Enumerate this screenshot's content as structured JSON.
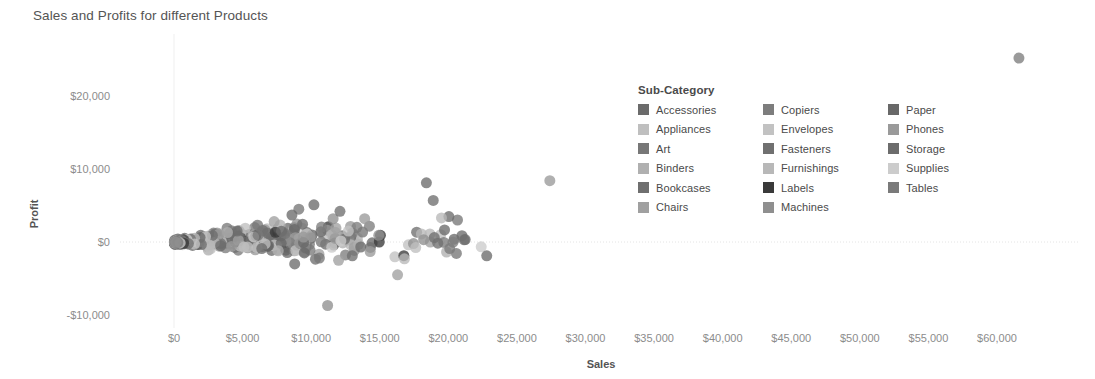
{
  "chart_data": {
    "type": "scatter",
    "title": "Sales and Profits for different Products",
    "xlabel": "Sales",
    "ylabel": "Profit",
    "xlim": [
      -1000,
      61800
    ],
    "ylim": [
      -13000,
      27500
    ],
    "grid": false,
    "zero_line": true,
    "legend": {
      "title": "Sub-Category",
      "position": "inside-top-right",
      "columns": 3,
      "entries": [
        {
          "label": "Accessories",
          "color": "#6b6b6b"
        },
        {
          "label": "Appliances",
          "color": "#bfbfbf"
        },
        {
          "label": "Art",
          "color": "#777777"
        },
        {
          "label": "Binders",
          "color": "#b0b0b0"
        },
        {
          "label": "Bookcases",
          "color": "#6f6f6f"
        },
        {
          "label": "Chairs",
          "color": "#a0a0a0"
        },
        {
          "label": "Copiers",
          "color": "#7d7d7d"
        },
        {
          "label": "Envelopes",
          "color": "#c2c2c2"
        },
        {
          "label": "Fasteners",
          "color": "#707070"
        },
        {
          "label": "Furnishings",
          "color": "#b8b8b8"
        },
        {
          "label": "Labels",
          "color": "#3a3a3a"
        },
        {
          "label": "Machines",
          "color": "#8f8f8f"
        },
        {
          "label": "Paper",
          "color": "#686868"
        },
        {
          "label": "Phones",
          "color": "#9a9a9a"
        },
        {
          "label": "Storage",
          "color": "#6c6c6c"
        },
        {
          "label": "Supplies",
          "color": "#cccccc"
        },
        {
          "label": "Tables",
          "color": "#7a7a7a"
        }
      ]
    },
    "x_ticks": [
      {
        "value": 0,
        "label": "$0"
      },
      {
        "value": 5000,
        "label": "$5,000"
      },
      {
        "value": 10000,
        "label": "$10,000"
      },
      {
        "value": 15000,
        "label": "$15,000"
      },
      {
        "value": 20000,
        "label": "$20,000"
      },
      {
        "value": 25000,
        "label": "$25,000"
      },
      {
        "value": 30000,
        "label": "$30,000"
      },
      {
        "value": 35000,
        "label": "$35,000"
      },
      {
        "value": 40000,
        "label": "$40,000"
      },
      {
        "value": 45000,
        "label": "$45,000"
      },
      {
        "value": 50000,
        "label": "$50,000"
      },
      {
        "value": 55000,
        "label": "$55,000"
      },
      {
        "value": 60000,
        "label": "$60,000"
      }
    ],
    "y_ticks": [
      {
        "value": 20000,
        "label": "$20,000"
      },
      {
        "value": 10000,
        "label": "$10,000"
      },
      {
        "value": 0,
        "label": "$0"
      },
      {
        "value": -10000,
        "label": "-$10,000"
      }
    ],
    "points": [
      {
        "x": 61599,
        "y": 25200,
        "c": "#7d7d7d"
      },
      {
        "x": 27400,
        "y": 8400,
        "c": "#9a9a9a"
      },
      {
        "x": 18400,
        "y": 8100,
        "c": "#6b6b6b"
      },
      {
        "x": 18900,
        "y": 5700,
        "c": "#6f6f6f"
      },
      {
        "x": 10200,
        "y": 5100,
        "c": "#6b6b6b"
      },
      {
        "x": 19500,
        "y": 3300,
        "c": "#b8b8b8"
      },
      {
        "x": 13900,
        "y": 3200,
        "c": "#9a9a9a"
      },
      {
        "x": 9100,
        "y": 4500,
        "c": "#777777"
      },
      {
        "x": 8600,
        "y": 3700,
        "c": "#6b6b6b"
      },
      {
        "x": 11600,
        "y": 3200,
        "c": "#8f8f8f"
      },
      {
        "x": 12100,
        "y": 4200,
        "c": "#6f6f6f"
      },
      {
        "x": 7300,
        "y": 2800,
        "c": "#a0a0a0"
      },
      {
        "x": 6100,
        "y": 2300,
        "c": "#777777"
      },
      {
        "x": 5200,
        "y": 1900,
        "c": "#bfbfbf"
      },
      {
        "x": 4600,
        "y": 1500,
        "c": "#6b6b6b"
      },
      {
        "x": 3900,
        "y": 1300,
        "c": "#b0b0b0"
      },
      {
        "x": 3300,
        "y": 1100,
        "c": "#a0a0a0"
      },
      {
        "x": 2800,
        "y": 900,
        "c": "#6c6c6c"
      },
      {
        "x": 2300,
        "y": 750,
        "c": "#c2c2c2"
      },
      {
        "x": 1900,
        "y": 600,
        "c": "#686868"
      },
      {
        "x": 1500,
        "y": 500,
        "c": "#b8b8b8"
      },
      {
        "x": 1200,
        "y": 400,
        "c": "#707070"
      },
      {
        "x": 950,
        "y": 330,
        "c": "#cccccc"
      },
      {
        "x": 720,
        "y": 260,
        "c": "#3a3a3a"
      },
      {
        "x": 560,
        "y": 200,
        "c": "#7a7a7a"
      },
      {
        "x": 420,
        "y": 150,
        "c": "#6b6b6b"
      },
      {
        "x": 300,
        "y": 110,
        "c": "#9a9a9a"
      },
      {
        "x": 220,
        "y": 80,
        "c": "#777777"
      },
      {
        "x": 150,
        "y": 50,
        "c": "#6f6f6f"
      },
      {
        "x": 100,
        "y": 30,
        "c": "#8f8f8f"
      },
      {
        "x": 14300,
        "y": -1300,
        "c": "#9a9a9a"
      },
      {
        "x": 16800,
        "y": -2300,
        "c": "#b8b8b8"
      },
      {
        "x": 20100,
        "y": -900,
        "c": "#7a7a7a"
      },
      {
        "x": 22800,
        "y": -1900,
        "c": "#6c6c6c"
      },
      {
        "x": 16300,
        "y": -4500,
        "c": "#a0a0a0"
      },
      {
        "x": 11200,
        "y": -8700,
        "c": "#8f8f8f"
      },
      {
        "x": 8800,
        "y": -3000,
        "c": "#6b6b6b"
      },
      {
        "x": 13000,
        "y": -1900,
        "c": "#6f6f6f"
      },
      {
        "x": 12000,
        "y": -2500,
        "c": "#a0a0a0"
      },
      {
        "x": 10600,
        "y": -2200,
        "c": "#777777"
      },
      {
        "x": 9500,
        "y": -1500,
        "c": "#686868"
      },
      {
        "x": 7600,
        "y": -1200,
        "c": "#b0b0b0"
      },
      {
        "x": 6400,
        "y": -900,
        "c": "#6b6b6b"
      },
      {
        "x": 5100,
        "y": -700,
        "c": "#bfbfbf"
      },
      {
        "x": 4200,
        "y": -600,
        "c": "#9a9a9a"
      },
      {
        "x": 3400,
        "y": -500,
        "c": "#6c6c6c"
      },
      {
        "x": 2600,
        "y": -420,
        "c": "#b8b8b8"
      },
      {
        "x": 2000,
        "y": -350,
        "c": "#707070"
      },
      {
        "x": 1500,
        "y": -280,
        "c": "#c2c2c2"
      },
      {
        "x": 1050,
        "y": -220,
        "c": "#6f6f6f"
      },
      {
        "x": 700,
        "y": -170,
        "c": "#3a3a3a"
      },
      {
        "x": 450,
        "y": -120,
        "c": "#cccccc"
      },
      {
        "x": 280,
        "y": -80,
        "c": "#7a7a7a"
      },
      {
        "x": 160,
        "y": -50,
        "c": "#8f8f8f"
      }
    ],
    "point_count_approx": 420,
    "marker": {
      "shape": "circle",
      "size_px": 11,
      "opacity": 0.78
    }
  }
}
